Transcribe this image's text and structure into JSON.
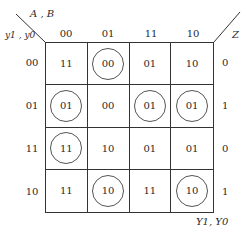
{
  "map": {
    "corner_top_label": "A , B",
    "corner_left_label": "y1 , y0",
    "corner_right_label": "Z",
    "bottom_label": "Y1, Y0",
    "columns": [
      "00",
      "01",
      "11",
      "10"
    ],
    "rows": [
      {
        "label": "00",
        "cells": [
          {
            "v": "11",
            "c": false
          },
          {
            "v": "00",
            "c": true
          },
          {
            "v": "01",
            "c": false
          },
          {
            "v": "10",
            "c": false
          }
        ],
        "z": "0"
      },
      {
        "label": "01",
        "cells": [
          {
            "v": "01",
            "c": true
          },
          {
            "v": "00",
            "c": false
          },
          {
            "v": "01",
            "c": true
          },
          {
            "v": "01",
            "c": true
          }
        ],
        "z": "1"
      },
      {
        "label": "11",
        "cells": [
          {
            "v": "11",
            "c": true
          },
          {
            "v": "10",
            "c": false
          },
          {
            "v": "01",
            "c": false
          },
          {
            "v": "01",
            "c": false
          }
        ],
        "z": "0"
      },
      {
        "label": "10",
        "cells": [
          {
            "v": "11",
            "c": false
          },
          {
            "v": "10",
            "c": true
          },
          {
            "v": "11",
            "c": false
          },
          {
            "v": "10",
            "c": true
          }
        ],
        "z": "1"
      }
    ]
  }
}
